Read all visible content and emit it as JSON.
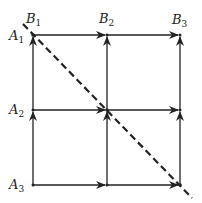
{
  "diagram": {
    "type": "grid-graph",
    "nodes_x": [
      33,
      107,
      180
    ],
    "nodes_y": [
      35,
      110,
      185
    ],
    "row_labels": [
      {
        "base": "A",
        "sub": "1"
      },
      {
        "base": "A",
        "sub": "2"
      },
      {
        "base": "A",
        "sub": "3"
      }
    ],
    "col_labels": [
      {
        "base": "B",
        "sub": "1"
      },
      {
        "base": "B",
        "sub": "2"
      },
      {
        "base": "B",
        "sub": "3"
      }
    ],
    "edges": "horizontal arrows point right, vertical arrows point up",
    "diagonal": {
      "style": "dashed",
      "from": "top-left (A1/B1)",
      "to": "bottom-right (A3/B3)"
    },
    "colors": {
      "line": "#222222",
      "background": "#ffffff"
    }
  }
}
